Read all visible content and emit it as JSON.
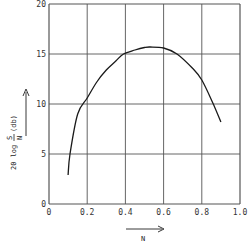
{
  "chart_data": {
    "type": "line",
    "title": "",
    "xlabel": "N",
    "ylabel": "20 log S/N (db)",
    "xlim": [
      0,
      1.0
    ],
    "ylim": [
      0,
      20
    ],
    "grid": true,
    "legend": null,
    "x_ticks": [
      "0",
      "0.2",
      "0.4",
      "0.6",
      "0.8",
      "1.0"
    ],
    "y_ticks": [
      "0",
      "5",
      "10",
      "15",
      "20"
    ],
    "series": [
      {
        "name": "20 log S/N",
        "x": [
          0.1,
          0.11,
          0.15,
          0.2,
          0.25,
          0.3,
          0.35,
          0.39,
          0.45,
          0.5,
          0.53,
          0.6,
          0.67,
          0.75,
          0.8,
          0.86,
          0.9
        ],
        "y": [
          2.9,
          5.0,
          9.0,
          10.6,
          12.2,
          13.4,
          14.3,
          15.0,
          15.4,
          15.65,
          15.7,
          15.6,
          15.0,
          13.6,
          12.4,
          10.0,
          8.2
        ]
      }
    ]
  },
  "axes": {
    "y_label_main": "20 log",
    "y_label_frac_num": "S",
    "y_label_frac_den": "N",
    "y_label_unit": "(db)",
    "x_label": "N"
  },
  "colors": {
    "line": "#1a1a1a",
    "grid": "#555555",
    "background": "#ffffff"
  }
}
